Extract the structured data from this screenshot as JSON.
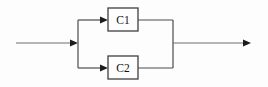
{
  "diagram": {
    "kind": "parallel-block-diagram",
    "blocks": [
      {
        "label": "C1"
      },
      {
        "label": "C2"
      }
    ],
    "colors": {
      "wire": "#6e6e6e",
      "structure_wire": "#4c4c4c",
      "arrowhead": "#1c1c1c",
      "box_border": "#3f3f3f",
      "label_text": "#111111",
      "background": "#fdfdfd"
    }
  }
}
